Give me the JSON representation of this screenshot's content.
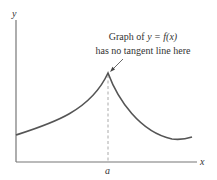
{
  "figure": {
    "annotation_line1_prefix": "Graph of ",
    "annotation_line1_math": "y = f(x)",
    "annotation_line2": "has no tangent line here",
    "y_axis_label": "y",
    "x_axis_label": "x",
    "x_tick_label": "a"
  },
  "colors": {
    "axes": "#555555",
    "curve": "#444444",
    "dashed_line": "#999999",
    "text": "#333333"
  }
}
